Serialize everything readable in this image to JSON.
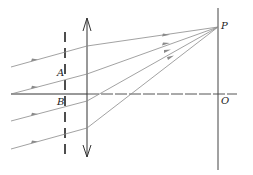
{
  "diagram": {
    "type": "optics-ray-diagram",
    "labels": {
      "point_p": "P",
      "point_o": "O",
      "point_a": "A",
      "point_b": "B"
    },
    "colors": {
      "line": "#333333",
      "ray": "#8a8a8a",
      "axis_dashed": "#555555",
      "background": "#ffffff"
    },
    "elements": {
      "lens": "double-arrow convex lens",
      "slit": "dashed screen with slits A and B",
      "screen": "vertical screen through P and O",
      "axis": "principal axis"
    },
    "rays": [
      {
        "start": [
          11,
          67
        ],
        "lens": [
          87,
          46
        ],
        "end": [
          218,
          27
        ]
      },
      {
        "start": [
          11,
          94
        ],
        "lens": [
          87,
          74
        ],
        "end": [
          218,
          27
        ]
      },
      {
        "start": [
          11,
          121
        ],
        "lens": [
          87,
          101
        ],
        "end": [
          218,
          27
        ]
      },
      {
        "start": [
          11,
          149
        ],
        "lens": [
          87,
          128
        ],
        "end": [
          218,
          27
        ]
      }
    ]
  }
}
